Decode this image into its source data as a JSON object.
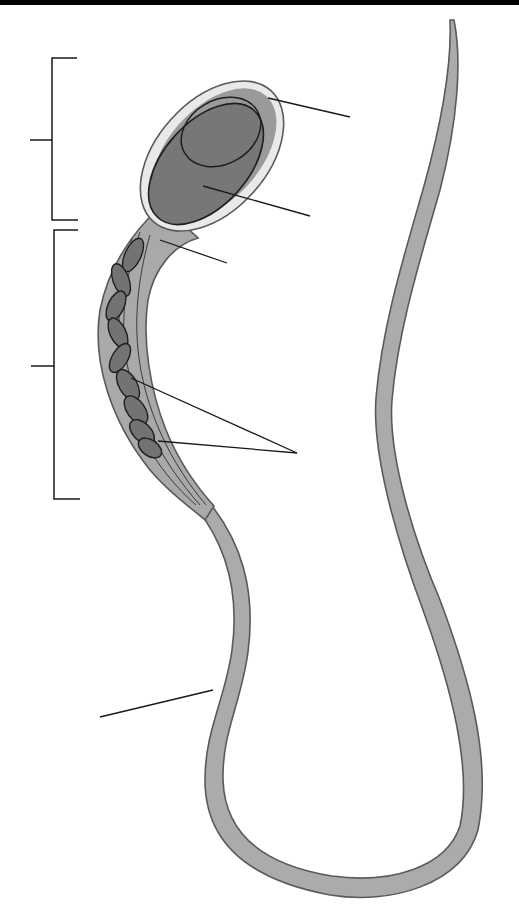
{
  "diagram": {
    "type": "unlabeled anatomical diagram",
    "labels": [],
    "colors": {
      "background": "#ffffff",
      "top_bar": "#000000",
      "outline": "#5a5a5a",
      "cytoplasm": "#a9a9a9",
      "acrosome_cap": "#e9e9e9",
      "nucleus": "#777777",
      "mitochondria": "#737373",
      "tail": "#ababab",
      "leader_line": "#1a1a1a"
    },
    "regions": [
      {
        "id": "head",
        "bracket": {
          "x": 52,
          "y_top": 58,
          "y_bottom": 220,
          "tick_y": 140,
          "tick_x0": 30
        }
      },
      {
        "id": "midpiece",
        "bracket": {
          "x": 54,
          "y_top": 230,
          "y_bottom": 499,
          "tick_y": 366,
          "tick_x0": 31
        }
      }
    ],
    "leader_lines": [
      {
        "target": "acrosome",
        "from": [
          268,
          98
        ],
        "to": [
          350,
          117
        ]
      },
      {
        "target": "nucleus",
        "from": [
          203,
          186
        ],
        "to": [
          310,
          216
        ]
      },
      {
        "target": "neck",
        "from": [
          160,
          240
        ],
        "to": [
          227,
          263
        ]
      },
      {
        "target": "mitochondria-1",
        "from": [
          131,
          378
        ],
        "to": [
          297,
          453
        ]
      },
      {
        "target": "mitochondria-2",
        "from": [
          158,
          441
        ],
        "to": [
          297,
          453
        ]
      },
      {
        "target": "tail",
        "from": [
          213,
          690
        ],
        "to": [
          100,
          717
        ]
      }
    ]
  }
}
